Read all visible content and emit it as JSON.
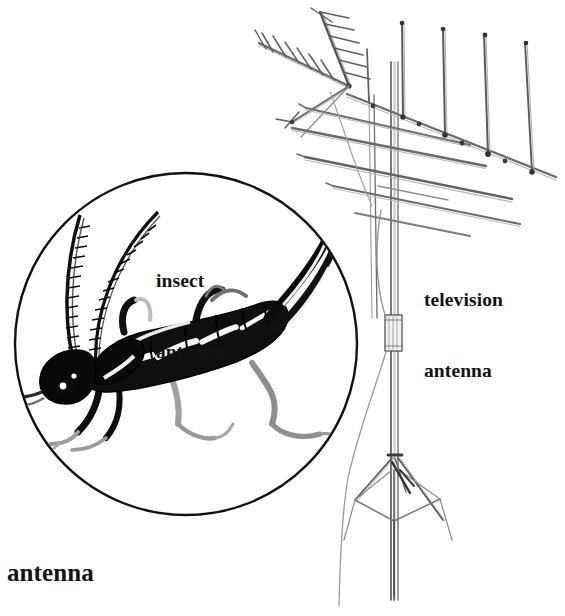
{
  "figure": {
    "title": "antenna",
    "style": "black-and-white pen-and-ink dictionary illustration",
    "background_color": "#ffffff",
    "ink_color": "#131313",
    "pencil_color": "#5a5a5a",
    "width": 565,
    "height": 616
  },
  "labels": {
    "insect": {
      "line1": "insect",
      "line2": "antenna"
    },
    "television": {
      "line1": "television",
      "line2": "antenna"
    },
    "caption": "antenna"
  },
  "illustrations": {
    "insect_circle": {
      "name": "insect antenna detail circle",
      "shape": "circle",
      "center_x": 186,
      "center_y": 344,
      "radius": 172,
      "subject": "earwig-like insect in profile with two long segmented antennae, six legs and rear forceps"
    },
    "television_antenna": {
      "name": "rooftop television antenna",
      "parts": [
        "vertical mast",
        "yagi boom with short director elements",
        "four long V dipole elements",
        "cross-element boom array",
        "cylindrical mast coupling",
        "feedline cable",
        "tripod base"
      ]
    }
  }
}
